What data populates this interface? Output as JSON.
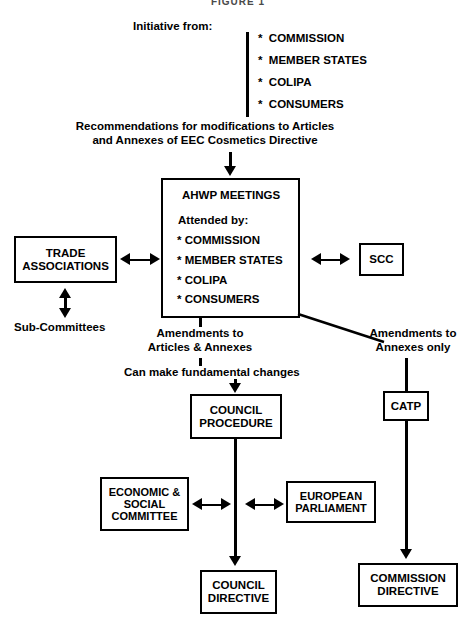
{
  "figure": {
    "title": "FIGURE 1"
  },
  "header": {
    "initiative_label": "Initiative from:",
    "sources": [
      "*  COMMISSION",
      "*  MEMBER STATES",
      "*  COLIPA",
      "*  CONSUMERS"
    ],
    "recommendation": "Recommendations for modifications to Articles\nand Annexes of EEC Cosmetics Directive"
  },
  "ahwp": {
    "title": "AHWP MEETINGS",
    "attended_label": "Attended by:",
    "attendees": [
      "*  COMMISSION",
      "*  MEMBER STATES",
      "*  COLIPA",
      "*  CONSUMERS"
    ]
  },
  "left_branch": {
    "trade_associations": "TRADE\nASSOCIATIONS",
    "sub_committees": "Sub-Committees"
  },
  "right_branch": {
    "scc": "SCC"
  },
  "paths": {
    "amendments_articles_annexes": "Amendments to\nArticles & Annexes",
    "fundamental_changes": "Can make fundamental changes",
    "amendments_annexes_only": "Amendments to\nAnnexes only"
  },
  "council_path": {
    "council_procedure": "COUNCIL\nPROCEDURE",
    "economic_social_committee": "ECONOMIC\n& SOCIAL\nCOMMITTEE",
    "european_parliament": "EUROPEAN\nPARLIAMENT",
    "council_directive": "COUNCIL\nDIRECTIVE"
  },
  "catp_path": {
    "catp": "CATP",
    "commission_directive": "COMMISSION\nDIRECTIVE"
  },
  "colors": {
    "ink": "#000000",
    "paper": "#ffffff"
  }
}
